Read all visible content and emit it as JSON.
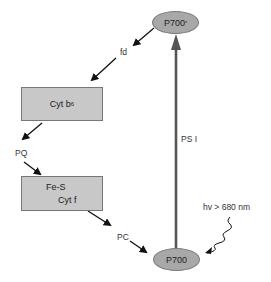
{
  "diagram": {
    "nodes": {
      "p700_star": {
        "label": "P700",
        "superscript": "*"
      },
      "p700": {
        "label": "P700"
      },
      "cyt_b6": {
        "label": "Cyt b",
        "subscript": "6"
      },
      "fes_cytf": {
        "line1": "Fe-S",
        "line2": "Cyt f"
      }
    },
    "carriers": {
      "fd": "fd",
      "pq": "PQ",
      "pc": "PC"
    },
    "labels": {
      "psi": "PS I",
      "light": "hv > 680 nm"
    },
    "colors": {
      "node_fill": "#a8a8a8",
      "box_fill": "#c8c8c8",
      "arrow": "#555555"
    }
  }
}
